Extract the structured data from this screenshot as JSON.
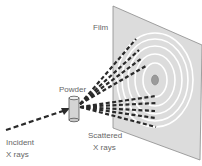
{
  "diagram": {
    "labels": {
      "film": "Film",
      "powder": "Powder",
      "incident_line1": "Incident",
      "incident_line2": "X rays",
      "scattered_line1": "Scattered",
      "scattered_line2": "X rays"
    },
    "colors": {
      "film_fill": "#dcdcdc",
      "film_edge": "#8a8a8a",
      "ring": "#ffffff",
      "spot": "#9a9a9a",
      "ray": "#2a2a2a",
      "powder_body": "#d4d4d4",
      "label": "#666666"
    },
    "ring_count": 5,
    "scattered_ray_groups": [
      "upper-cone",
      "lower-cone"
    ]
  }
}
